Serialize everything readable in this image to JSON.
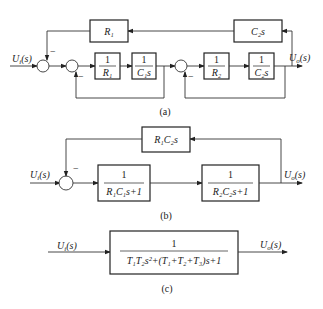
{
  "diagram_a": {
    "caption": "(a)",
    "input": "U_i(s)",
    "output": "U_o(s)",
    "blocks": {
      "feedback_r1": "R₁",
      "feedback_c2s": "C₂s",
      "g1_num": "1",
      "g1_den": "R₁",
      "g2_num": "1",
      "g2_den": "C₁s",
      "g3_num": "1",
      "g3_den": "R₂",
      "g4_num": "1",
      "g4_den": "C₂s"
    },
    "signs": {
      "minus": "−"
    }
  },
  "diagram_b": {
    "caption": "(b)",
    "input": "U_i(s)",
    "output": "U_o(s)",
    "blocks": {
      "feedback": "R₁C₂s",
      "g1_num": "1",
      "g1_den": "R₁C₁s+1",
      "g2_num": "1",
      "g2_den": "R₂C₂s+1"
    },
    "signs": {
      "minus": "−"
    }
  },
  "diagram_c": {
    "caption": "(c)",
    "input": "U_i(s)",
    "output": "U_o(s)",
    "block": {
      "num": "1",
      "den": "T₁T₂s²+(T₁+T₂+T₃)s+1"
    }
  },
  "labels": {
    "in_a": "U",
    "in_a_sub": "i",
    "in_a_rest": "(s)",
    "out_a": "U",
    "out_a_sub": "o",
    "out_a_rest": "(s)"
  }
}
